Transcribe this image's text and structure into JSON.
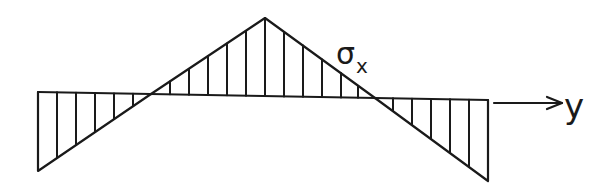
{
  "diagram": {
    "type": "stress-distribution",
    "axis": {
      "label": "y",
      "direction": "right"
    },
    "curve_label": {
      "symbol": "σ",
      "subscript": "x"
    },
    "colors": {
      "line": "#1a1a1a",
      "background": "#ffffff"
    },
    "geometry": {
      "left_edge": {
        "x": 38,
        "top_y": 92,
        "bottom_y": 171
      },
      "left_zero": {
        "x": 151,
        "y": 94
      },
      "peak": {
        "x": 265,
        "y": 18
      },
      "right_zero": {
        "x": 375,
        "y": 98
      },
      "right_edge": {
        "x": 488,
        "top_y": 100,
        "bottom_y": 181
      },
      "arrow": {
        "x1": 494,
        "x2": 563,
        "y": 103
      }
    },
    "regions": [
      {
        "name": "left-negative",
        "sign": "negative",
        "hatch_count": 6
      },
      {
        "name": "middle-positive",
        "sign": "positive",
        "hatch_count": 11
      },
      {
        "name": "right-negative",
        "sign": "negative",
        "hatch_count": 6
      }
    ]
  }
}
